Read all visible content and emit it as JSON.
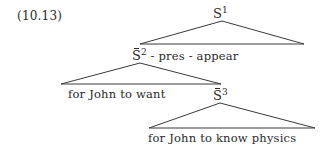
{
  "example_number": "(10.13)",
  "tree": {
    "root": {
      "category": "S",
      "index": "1",
      "overbar": false
    },
    "complement_node": {
      "category": "S",
      "index": "2",
      "overbar": true,
      "suffix": " - pres - appear"
    },
    "complement_left_text": "for John to want",
    "embedded_node": {
      "category": "S",
      "index": "3",
      "overbar": true
    },
    "embedded_text": "for John to know physics"
  },
  "style": {
    "ink_color": "#2a2a2a",
    "background": "#ffffff"
  }
}
